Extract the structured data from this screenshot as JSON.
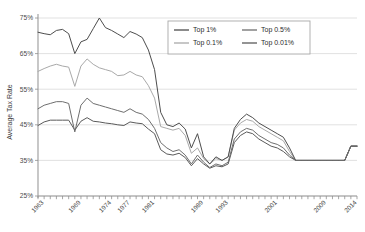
{
  "chart_data": {
    "type": "line",
    "title": "",
    "xlabel": "",
    "ylabel": "Average Tax Rate",
    "ylim": [
      25,
      75
    ],
    "ytick_values": [
      25,
      35,
      45,
      55,
      65,
      75
    ],
    "ytick_labels": [
      "25%",
      "35%",
      "45%",
      "55%",
      "65%",
      "75%"
    ],
    "xlim": [
      1962,
      2014
    ],
    "xtick_labels": [
      "1963",
      "1969",
      "1974",
      "1977",
      "1981",
      "1989",
      "1993",
      "2001",
      "2009",
      "2014"
    ],
    "xtick_years": [
      1963,
      1969,
      1974,
      1977,
      1981,
      1989,
      1993,
      2001,
      2009,
      2014
    ],
    "grid": "horizontal",
    "legend_position": "top-right",
    "x": [
      1962,
      1963,
      1964,
      1965,
      1966,
      1967,
      1968,
      1969,
      1970,
      1971,
      1972,
      1973,
      1974,
      1975,
      1976,
      1977,
      1978,
      1979,
      1980,
      1981,
      1982,
      1983,
      1984,
      1985,
      1986,
      1987,
      1988,
      1989,
      1990,
      1991,
      1992,
      1993,
      1994,
      1995,
      1996,
      1997,
      1998,
      1999,
      2000,
      2001,
      2002,
      2003,
      2004,
      2005,
      2006,
      2007,
      2008,
      2009,
      2010,
      2011,
      2012,
      2013,
      2014
    ],
    "series": [
      {
        "name": "Top 1%",
        "color": "#4d4d4d",
        "values": [
          71.0,
          70.6,
          70.3,
          71.5,
          71.8,
          70.6,
          65.0,
          68.3,
          69.0,
          72.0,
          75.0,
          72.3,
          71.5,
          70.5,
          69.5,
          71.2,
          70.5,
          69.5,
          66.0,
          60.5,
          48.5,
          45.0,
          44.5,
          45.5,
          43.8,
          38.5,
          42.5,
          36.0,
          34.0,
          36.0,
          35.0,
          36.0,
          44.0,
          46.5,
          48.0,
          47.0,
          45.5,
          44.5,
          43.5,
          42.5,
          41.5,
          38.5,
          35.0,
          35.0,
          35.0,
          35.0,
          35.0,
          35.0,
          35.0,
          35.0,
          35.0,
          39.0,
          39.0
        ]
      },
      {
        "name": "Top 0.5%",
        "color": "#6e6e6e",
        "values": [
          49.5,
          50.5,
          51.0,
          51.5,
          51.5,
          51.0,
          43.0,
          50.5,
          52.5,
          51.0,
          50.5,
          50.0,
          49.5,
          49.0,
          48.5,
          49.5,
          48.5,
          48.0,
          46.5,
          44.0,
          40.0,
          38.5,
          37.5,
          38.0,
          36.5,
          34.0,
          36.5,
          34.5,
          33.0,
          34.0,
          33.5,
          34.5,
          41.0,
          43.0,
          44.0,
          43.5,
          42.0,
          41.0,
          40.0,
          39.5,
          38.5,
          36.5,
          35.0,
          35.0,
          35.0,
          35.0,
          35.0,
          35.0,
          35.0,
          35.0,
          35.0,
          39.0,
          39.0
        ]
      },
      {
        "name": "Top 0.1%",
        "color": "#a9a9a9",
        "values": [
          60.0,
          60.8,
          61.5,
          62.0,
          61.5,
          61.2,
          55.8,
          61.5,
          63.5,
          62.0,
          61.0,
          60.5,
          60.0,
          58.8,
          59.0,
          60.0,
          59.0,
          58.5,
          56.0,
          52.5,
          44.5,
          44.0,
          43.5,
          44.0,
          42.0,
          37.0,
          38.5,
          35.5,
          34.0,
          35.5,
          35.0,
          36.0,
          43.5,
          45.5,
          46.5,
          46.0,
          44.5,
          43.5,
          42.5,
          41.5,
          40.5,
          37.5,
          35.0,
          35.0,
          35.0,
          35.0,
          35.0,
          35.0,
          35.0,
          35.0,
          35.0,
          39.0,
          39.0
        ]
      },
      {
        "name": "Top 0.01%",
        "color": "#5a5a5a",
        "values": [
          44.8,
          45.8,
          46.3,
          46.3,
          46.3,
          46.3,
          43.5,
          46.0,
          47.0,
          46.0,
          45.8,
          45.5,
          45.3,
          45.0,
          44.8,
          45.8,
          45.5,
          45.3,
          43.8,
          42.5,
          38.0,
          36.8,
          36.5,
          37.0,
          35.8,
          33.5,
          35.5,
          34.0,
          32.8,
          33.5,
          33.2,
          34.0,
          40.0,
          42.0,
          43.0,
          42.5,
          41.0,
          40.0,
          39.0,
          38.5,
          37.5,
          36.0,
          35.0,
          35.0,
          35.0,
          35.0,
          35.0,
          35.0,
          35.0,
          35.0,
          35.0,
          39.0,
          39.0
        ]
      }
    ],
    "legend": [
      {
        "label": "Top 1%",
        "color": "#4d4d4d"
      },
      {
        "label": "Top 0.5%",
        "color": "#6e6e6e"
      },
      {
        "label": "Top 0.1%",
        "color": "#a9a9a9"
      },
      {
        "label": "Top 0.01%",
        "color": "#5a5a5a"
      }
    ]
  }
}
